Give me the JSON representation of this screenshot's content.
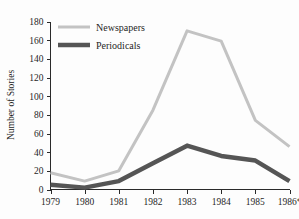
{
  "chart_data": {
    "type": "line",
    "title": "",
    "subtitle": "",
    "xlabel": "",
    "ylabel": "Number of Stories",
    "categories": [
      "1979",
      "1980",
      "1981",
      "1982",
      "1983",
      "1984",
      "1985",
      "1986*"
    ],
    "x_tick_labels": [
      "1979",
      "1980",
      "1981",
      "1982",
      "1983",
      "1984",
      "1985",
      "1986*"
    ],
    "y_tick_labels": [
      "0",
      "20",
      "40",
      "60",
      "80",
      "100",
      "120",
      "140",
      "160",
      "180"
    ],
    "y_ticks": [
      0,
      20,
      40,
      60,
      80,
      100,
      120,
      140,
      160,
      180
    ],
    "ylim": [
      0,
      180
    ],
    "grid": false,
    "legend_position": "top-center",
    "series": [
      {
        "name": "Newspapers",
        "color": "#c3c3c3",
        "line_width": 3,
        "values": [
          18,
          9,
          20,
          85,
          170,
          159,
          74,
          46
        ]
      },
      {
        "name": "Periodicals",
        "color": "#555555",
        "line_width": 4.5,
        "values": [
          5,
          2,
          9,
          28,
          47,
          36,
          31,
          9
        ]
      }
    ],
    "annotations": [
      "* indicates partial-year data for 1986"
    ]
  },
  "legend": {
    "items": [
      {
        "label": "Newspapers",
        "color": "#c3c3c3"
      },
      {
        "label": "Periodicals",
        "color": "#555555"
      }
    ]
  },
  "axes": {
    "y_axis_title": "Number of Stories"
  }
}
